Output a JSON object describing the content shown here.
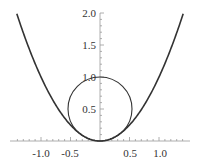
{
  "chart_data": {
    "type": "line",
    "title": "",
    "xlabel": "",
    "ylabel": "",
    "xlim": [
      -1.45,
      1.45
    ],
    "ylim": [
      0,
      2.0
    ],
    "grid": false,
    "legend": null,
    "x_ticks": [
      "-1.0",
      "-0.5",
      "0.5",
      "1.0"
    ],
    "y_ticks": [
      "0.5",
      "1.0",
      "1.5",
      "2.0"
    ],
    "series": [
      {
        "name": "parabola",
        "equation": "y = x^2",
        "x_range": [
          -1.41,
          1.41
        ],
        "color": "#333333"
      },
      {
        "name": "circle",
        "equation": "x^2 + (y - 0.5)^2 = 0.25",
        "center": [
          0,
          0.5
        ],
        "radius": 0.5,
        "color": "#333333"
      }
    ]
  },
  "axes": {
    "x_ticks": [
      "-1.0",
      "-0.5",
      "0.5",
      "1.0"
    ],
    "y_ticks": [
      "0.5",
      "1.0",
      "1.5",
      "2.0"
    ]
  }
}
